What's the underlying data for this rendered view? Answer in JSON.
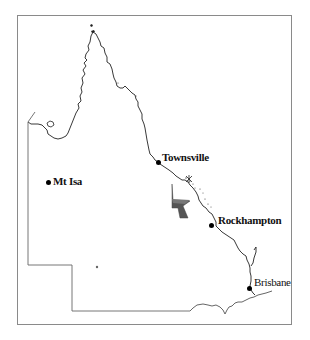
{
  "map": {
    "title": "Queensland",
    "frame": {
      "border_color": "#8a8a8a"
    },
    "colors": {
      "coastline": "#222222",
      "border": "#666666",
      "shaded_region": "#555555",
      "city_marker": "#000000"
    },
    "cities": [
      {
        "name": "Townsville",
        "x": 160,
        "y": 162
      },
      {
        "name": "Mt Isa",
        "x": 49,
        "y": 183
      },
      {
        "name": "Rockhampton",
        "x": 212,
        "y": 225
      },
      {
        "name": "Brisbane",
        "x": 250,
        "y": 288
      }
    ],
    "shaded_region_label": "",
    "minor_marker": {
      "x": 97,
      "y": 267
    }
  }
}
